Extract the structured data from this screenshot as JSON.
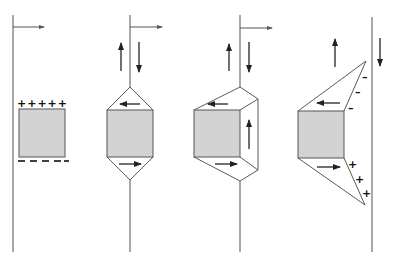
{
  "figure": {
    "colors": {
      "plate_fill": "#d3d3d3",
      "line": "#6e6e6e",
      "arrow": "#222222"
    },
    "panels": [
      {
        "id": "panel-1",
        "top_charges": "+ + + + +",
        "bottom_charges": "– – – – –"
      },
      {
        "id": "panel-2"
      },
      {
        "id": "panel-3"
      },
      {
        "id": "panel-4",
        "upper_charges": [
          "–",
          "–",
          "–"
        ],
        "lower_charges": [
          "+",
          "+",
          "+"
        ]
      }
    ]
  }
}
